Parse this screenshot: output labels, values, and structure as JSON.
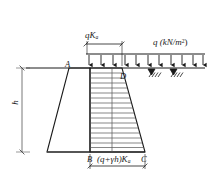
{
  "figure": {
    "type": "engineering-diagram",
    "background_color": "#ffffff",
    "line_color": "#1a1a1a",
    "hatch_color": "#555555"
  },
  "labels": {
    "surcharge_pressure": "qK",
    "surcharge_pressure_sub": "a",
    "surcharge_load": "q (kN/m",
    "surcharge_load_sup": "2",
    "surcharge_load_close": ")",
    "point_a": "A",
    "point_b": "B",
    "point_c": "C",
    "point_d": "D",
    "wall_height": "h",
    "base_pressure_pre": "(q+",
    "base_pressure_gamma": "γ",
    "base_pressure_mid": "h)K",
    "base_pressure_sub": "a"
  },
  "geometry": {
    "ground_line_y": 68,
    "base_line_y": 152,
    "wall_top_left_x": 69,
    "wall_top_right_x": 90,
    "wall_bottom_left_x": 47,
    "wall_bottom_right_x": 90,
    "pressure_top_left_x": 90,
    "pressure_top_right_x": 122,
    "pressure_bottom_right_x": 145,
    "load_band_left_x": 86,
    "load_band_right_x": 205,
    "load_arrow_count": 11,
    "hatch_line_count": 17
  },
  "dimensions": {
    "top_dim_left_x": 86,
    "top_dim_right_x": 122,
    "top_dim_y": 44,
    "bottom_dim_left_x": 90,
    "bottom_dim_right_x": 145,
    "bottom_dim_y": 166,
    "height_dim_x": 22,
    "height_dim_top_y": 68,
    "height_dim_bottom_y": 152
  }
}
